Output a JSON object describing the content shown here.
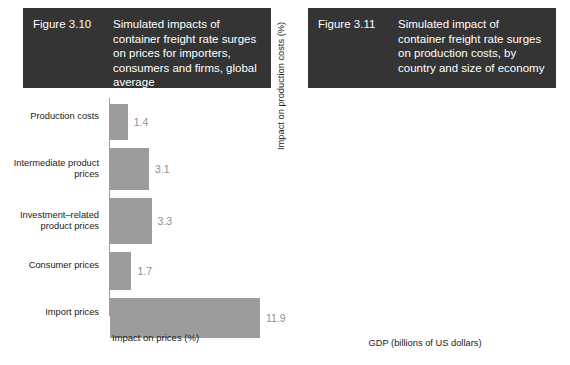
{
  "figure_left": {
    "number": "Figure 3.10",
    "title": "Simulated impacts of container freight rate surges on prices for importers, consumers and firms, global average"
  },
  "figure_right": {
    "number": "Figure 3.11",
    "title": "Simulated impact of container freight rate surges on production costs, by country and size of economy"
  },
  "chart_data": [
    {
      "type": "bar",
      "orientation": "horizontal",
      "title": "Simulated impacts of container freight rate surges on prices for importers, consumers and firms, global average",
      "xlabel": "Impact on prices (%)",
      "ylabel": "",
      "xlim": [
        0,
        13.5
      ],
      "grid": false,
      "legend": "none",
      "bar_color": "#9c9c9c",
      "categories": [
        "Production costs",
        "Intermediate product prices",
        "Investment–related product prices",
        "Consumer prices",
        "Import prices"
      ],
      "values": [
        1.4,
        3.1,
        3.3,
        1.7,
        11.9
      ],
      "value_labels": [
        "1.4",
        "3.1",
        "3.3",
        "1.7",
        "11.9"
      ]
    },
    {
      "type": "scatter",
      "title": "Simulated impact of container freight rate surges on production costs, by country and size of economy",
      "xlabel": "GDP (billions of US dollars)",
      "ylabel": "Impact on production costs (%)",
      "xscale": "log",
      "xticks": [
        100,
        1000,
        10000
      ],
      "xtick_labels": [
        "100",
        "1 000",
        "10 000"
      ],
      "yticks": [
        1,
        2,
        3,
        4,
        5
      ],
      "ytick_labels": [
        "1",
        "2",
        "3",
        "4",
        "5"
      ],
      "ylim": [
        0.5,
        5.3
      ],
      "xlim": [
        20,
        25000
      ],
      "grid": false,
      "legend": "none",
      "point_color": "#8f8f8f",
      "trendline": true,
      "points": [
        {
          "code": "TWN",
          "x": 790,
          "y": 4.72,
          "lx": -17,
          "ly": 9
        },
        {
          "code": "SVK",
          "x": 115,
          "y": 3.86,
          "lx": 3,
          "ly": -5
        },
        {
          "code": "CZE",
          "x": 280,
          "y": 3.36,
          "lx": -3,
          "ly": -5
        },
        {
          "code": "KOR",
          "x": 1700,
          "y": 3.36,
          "lx": -3,
          "ly": 11
        },
        {
          "code": "EST",
          "x": 36,
          "y": 3.07,
          "lx": -6,
          "ly": -5
        },
        {
          "code": "HUN",
          "x": 160,
          "y": 3.12,
          "lx": -4,
          "ly": 11
        },
        {
          "code": "LTU",
          "x": 55,
          "y": 2.8,
          "lx": -6,
          "ly": -5
        },
        {
          "code": "BGR",
          "x": 80,
          "y": 2.65,
          "lx": 6,
          "ly": 4
        },
        {
          "code": "SVN",
          "x": 54,
          "y": 2.45,
          "lx": -19,
          "ly": 2
        },
        {
          "code": "BEL",
          "x": 530,
          "y": 2.55,
          "lx": -6,
          "ly": -16
        },
        {
          "code": "ROU",
          "x": 250,
          "y": 2.47,
          "lx": -25,
          "ly": -1
        },
        {
          "code": "AUT",
          "x": 430,
          "y": 2.44,
          "lx": -18,
          "ly": -10
        },
        {
          "code": "POL",
          "x": 600,
          "y": 2.52,
          "lx": 1,
          "ly": -14
        },
        {
          "code": "NLD",
          "x": 900,
          "y": 2.52,
          "lx": 8,
          "ly": -16
        },
        {
          "code": "TUR",
          "x": 760,
          "y": 2.37,
          "lx": -16,
          "ly": -3
        },
        {
          "code": "MEX",
          "x": 1200,
          "y": 2.37,
          "lx": 3,
          "ly": -9
        },
        {
          "code": "IND",
          "x": 2800,
          "y": 2.32,
          "lx": 15,
          "ly": -14
        },
        {
          "code": "CAN",
          "x": 1900,
          "y": 2.24,
          "lx": -3,
          "ly": -7
        },
        {
          "code": "JPN",
          "x": 4900,
          "y": 2.23,
          "lx": -2,
          "ly": -8
        },
        {
          "code": "CHN",
          "x": 17000,
          "y": 2.1,
          "lx": 7,
          "ly": 3
        },
        {
          "code": "LVA",
          "x": 33,
          "y": 2.08,
          "lx": 2,
          "ly": -6
        },
        {
          "code": "HRV",
          "x": 63,
          "y": 2.12,
          "lx": -4,
          "ly": -7
        },
        {
          "code": "PRT",
          "x": 250,
          "y": 2.11,
          "lx": -1,
          "ly": -7
        },
        {
          "code": "MLT",
          "x": 17,
          "y": 1.95,
          "lx": -7,
          "ly": 11
        },
        {
          "code": "CYP",
          "x": 28,
          "y": 1.93,
          "lx": -4,
          "ly": 11
        },
        {
          "code": "DNK",
          "x": 390,
          "y": 1.98,
          "lx": -27,
          "ly": 1
        },
        {
          "code": "FIN",
          "x": 300,
          "y": 2.12,
          "lx": -9,
          "ly": 5
        },
        {
          "code": "SWE",
          "x": 590,
          "y": 2.0,
          "lx": -9,
          "ly": 9
        },
        {
          "code": "ESP",
          "x": 1400,
          "y": 2.01,
          "lx": 0,
          "ly": 9
        },
        {
          "code": "FRA",
          "x": 2900,
          "y": 2.07,
          "lx": -2,
          "ly": -5
        },
        {
          "code": "DEU",
          "x": 4200,
          "y": 1.9,
          "lx": 2,
          "ly": 8
        },
        {
          "code": "IRL",
          "x": 500,
          "y": 1.82,
          "lx": -22,
          "ly": 1
        },
        {
          "code": "AUS",
          "x": 1500,
          "y": 1.8,
          "lx": -8,
          "ly": 9
        },
        {
          "code": "ITA",
          "x": 2100,
          "y": 1.7,
          "lx": -3,
          "ly": 9
        },
        {
          "code": "BRA",
          "x": 1800,
          "y": 1.62,
          "lx": 7,
          "ly": 12
        },
        {
          "code": "GBR",
          "x": 3100,
          "y": 1.68,
          "lx": 14,
          "ly": 13
        },
        {
          "code": "GRC",
          "x": 190,
          "y": 1.72,
          "lx": -25,
          "ly": 8
        },
        {
          "code": "NOR",
          "x": 420,
          "y": 1.67,
          "lx": -11,
          "ly": 11
        },
        {
          "code": "CHE",
          "x": 800,
          "y": 1.55,
          "lx": -2,
          "ly": 16
        },
        {
          "code": "RUS",
          "x": 1600,
          "y": 1.42,
          "lx": -2,
          "ly": 15
        },
        {
          "code": "USA",
          "x": 21000,
          "y": 1.3,
          "lx": -26,
          "ly": 2
        },
        {
          "code": "LUX",
          "x": 70,
          "y": 1.08,
          "lx": -3,
          "ly": 13
        }
      ],
      "trend_start": {
        "x": 28,
        "y": 2.33
      },
      "trend_end": {
        "x": 22000,
        "y": 1.82
      }
    }
  ]
}
